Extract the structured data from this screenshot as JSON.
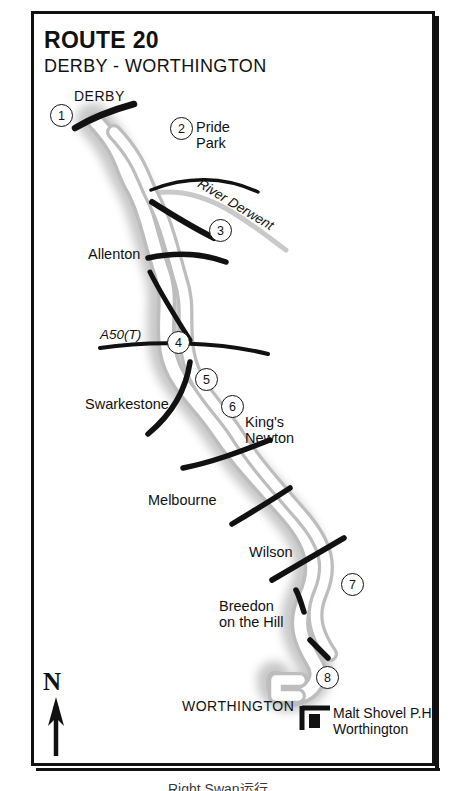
{
  "map": {
    "title": "ROUTE 20",
    "subtitle": "DERBY - WORTHINGTON",
    "caption": "Right Swan运行",
    "stops": [
      {
        "number": "1",
        "x": 50,
        "y": 104
      },
      {
        "number": "2",
        "x": 170,
        "y": 117
      },
      {
        "number": "3",
        "x": 209,
        "y": 219
      },
      {
        "number": "4",
        "x": 167,
        "y": 331
      },
      {
        "number": "5",
        "x": 195,
        "y": 368
      },
      {
        "number": "6",
        "x": 221,
        "y": 395
      },
      {
        "number": "7",
        "x": 341,
        "y": 573
      },
      {
        "number": "8",
        "x": 316,
        "y": 666
      }
    ],
    "places": [
      {
        "name": "DERBY",
        "x": 74,
        "y": 88,
        "style": "cap"
      },
      {
        "name": "Pride\nPark",
        "x": 196,
        "y": 119,
        "style": ""
      },
      {
        "name": "River Derwent",
        "x": 203,
        "y": 176,
        "style": "ital"
      },
      {
        "name": "Allenton",
        "x": 88,
        "y": 246,
        "style": ""
      },
      {
        "name": "A50(T)",
        "x": 100,
        "y": 327,
        "style": "ital"
      },
      {
        "name": "Swarkestone",
        "x": 85,
        "y": 396,
        "style": ""
      },
      {
        "name": "King's\nNewton",
        "x": 245,
        "y": 414,
        "style": ""
      },
      {
        "name": "Melbourne",
        "x": 148,
        "y": 492,
        "style": ""
      },
      {
        "name": "Wilson",
        "x": 249,
        "y": 544,
        "style": ""
      },
      {
        "name": "Breedon\non the Hill",
        "x": 219,
        "y": 598,
        "style": ""
      },
      {
        "name": "WORTHINGTON",
        "x": 182,
        "y": 698,
        "style": "cap"
      }
    ],
    "north_label": "N",
    "legend": {
      "marker_name": "pub-building-marker",
      "text": "Malt Shovel P.H.\nWorthington"
    },
    "colors": {
      "ink": "#111111",
      "route_fill": "#ffffff",
      "route_edge": "#b9b9b9",
      "halo": "#d8d8d8",
      "river": "#c4c4c4"
    }
  }
}
